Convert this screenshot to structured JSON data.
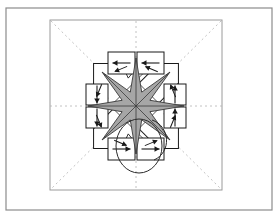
{
  "figure": {
    "background_color": "#ffffff",
    "outer_frame": {
      "name": "outer-frame",
      "x": 6,
      "y": 8,
      "width": 266,
      "height": 202,
      "stroke": "#8c8c8c",
      "stroke_width": 1.2,
      "fill": "none"
    },
    "inner_frame": {
      "name": "inner-frame",
      "x": 50,
      "y": 20,
      "width": 172,
      "height": 170,
      "stroke": "#9a9a9a",
      "stroke_width": 1.0,
      "fill": "none"
    },
    "center": {
      "x": 136,
      "y": 106
    },
    "colors": {
      "line": "#1a1a1a",
      "star_fill": "#a6a6a6",
      "star_fill_dark": "#8f8f8f",
      "panel_fill": "#ffffff",
      "guide": "#b0b0b0",
      "frame": "#8c8c8c"
    },
    "guides": {
      "name": "symmetry-axes",
      "stroke": "#b3b3b3",
      "dash": "2 3",
      "lines": [
        {
          "label": "horizontal-axis",
          "x1": 50,
          "y1": 106,
          "x2": 222,
          "y2": 106
        },
        {
          "label": "vertical-axis",
          "x1": 136,
          "y1": 21,
          "x2": 136,
          "y2": 189
        },
        {
          "label": "diagonal-axis-nw-se",
          "x1": 51,
          "y1": 21,
          "x2": 221,
          "y2": 189
        },
        {
          "label": "diagonal-axis-ne-sw",
          "x1": 221,
          "y1": 21,
          "x2": 51,
          "y2": 189
        }
      ]
    },
    "star": {
      "name": "eight-point-star",
      "points": 8,
      "outer_radius": 48,
      "inner_radius": 15,
      "fill": "#a6a6a6",
      "stroke": "#3a3a3a",
      "rotation_deg": 0
    },
    "panels": [
      {
        "name": "panel-top-left",
        "arrow": "left",
        "arrow_glyph": "←",
        "x": 108,
        "y": 52,
        "w": 27,
        "h": 22
      },
      {
        "name": "panel-top-right",
        "arrow": "left",
        "arrow_glyph": "←",
        "x": 137,
        "y": 52,
        "w": 27,
        "h": 22
      },
      {
        "name": "panel-left-upper",
        "arrow": "down",
        "arrow_glyph": "↓",
        "x": 86,
        "y": 84,
        "w": 22,
        "h": 21
      },
      {
        "name": "panel-left-lower",
        "arrow": "down",
        "arrow_glyph": "↓",
        "x": 86,
        "y": 107,
        "w": 22,
        "h": 21
      },
      {
        "name": "panel-right-upper",
        "arrow": "up",
        "arrow_glyph": "↑",
        "x": 164,
        "y": 84,
        "w": 22,
        "h": 21
      },
      {
        "name": "panel-right-lower",
        "arrow": "up",
        "arrow_glyph": "↑",
        "x": 164,
        "y": 107,
        "w": 22,
        "h": 21
      },
      {
        "name": "panel-bottom-left",
        "arrow": "right",
        "arrow_glyph": "→",
        "x": 108,
        "y": 138,
        "w": 27,
        "h": 22
      },
      {
        "name": "panel-bottom-right",
        "arrow": "right",
        "arrow_glyph": "→",
        "x": 137,
        "y": 138,
        "w": 27,
        "h": 22
      }
    ],
    "flaps": [
      {
        "name": "flap-north-west",
        "angle_deg": 225
      },
      {
        "name": "flap-north-east",
        "angle_deg": 315
      },
      {
        "name": "flap-south-east",
        "angle_deg": 45
      },
      {
        "name": "flap-south-west",
        "angle_deg": 135
      }
    ],
    "loop": {
      "name": "annotation-loop",
      "cx": 139,
      "cy": 146,
      "rx": 23,
      "ry": 27,
      "stroke": "#2a2a2a",
      "fill": "none",
      "stroke_width": 1.0
    },
    "loop_tail": {
      "name": "annotation-loop-tail",
      "path": "M 152 120 C 170 126 172 152 154 160",
      "stroke": "#2a2a2a"
    },
    "barbs_count": 16,
    "diagonal_arrows_count": 8
  }
}
